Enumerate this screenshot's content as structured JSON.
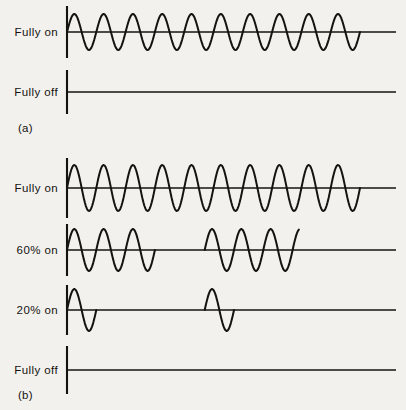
{
  "figure": {
    "background_color": "#f2f1ee",
    "ink_color": "#151310",
    "panels": [
      {
        "id": "a",
        "label": "(a)",
        "label_x": 18,
        "label_y": 122,
        "rows": [
          {
            "name": "fully-on",
            "label": "Fully on",
            "label_x": 58,
            "baseline_y": 32,
            "axis_x": 67,
            "axis_half_height": 26,
            "wave_start_x": 67,
            "wave_end_x": 360,
            "line_end_x": 396,
            "cycles": 10,
            "amplitude": 18,
            "burst_pattern": [
              [
                0,
                10
              ]
            ]
          },
          {
            "name": "fully-off",
            "label": "Fully off",
            "label_x": 58,
            "baseline_y": 92,
            "axis_x": 67,
            "axis_half_height": 22,
            "wave_start_x": 67,
            "wave_end_x": 67,
            "line_end_x": 396,
            "cycles": 10,
            "amplitude": 0,
            "burst_pattern": []
          }
        ]
      },
      {
        "id": "b",
        "label": "(b)",
        "label_x": 18,
        "label_y": 389,
        "rows": [
          {
            "name": "fully-on",
            "label": "Fully on",
            "label_x": 58,
            "baseline_y": 188,
            "axis_x": 67,
            "axis_half_height": 30,
            "wave_start_x": 67,
            "wave_end_x": 360,
            "line_end_x": 396,
            "cycles": 10,
            "amplitude": 23,
            "burst_pattern": [
              [
                0,
                10
              ]
            ]
          },
          {
            "name": "sixty-percent-on",
            "label": "60% on",
            "label_x": 58,
            "baseline_y": 250,
            "axis_x": 67,
            "axis_half_height": 26,
            "wave_start_x": 67,
            "wave_end_x": 360,
            "line_end_x": 396,
            "cycles": 10,
            "amplitude": 21,
            "burst_pattern": [
              [
                0,
                3
              ],
              [
                4.7,
                7.9
              ]
            ]
          },
          {
            "name": "twenty-percent-on",
            "label": "20% on",
            "label_x": 58,
            "baseline_y": 310,
            "axis_x": 67,
            "axis_half_height": 25,
            "wave_start_x": 67,
            "wave_end_x": 360,
            "line_end_x": 396,
            "cycles": 10,
            "amplitude": 21,
            "burst_pattern": [
              [
                0,
                1
              ],
              [
                4.7,
                5.7
              ]
            ]
          },
          {
            "name": "fully-off",
            "label": "Fully off",
            "label_x": 58,
            "baseline_y": 370,
            "axis_x": 67,
            "axis_half_height": 24,
            "wave_start_x": 67,
            "wave_end_x": 67,
            "line_end_x": 396,
            "cycles": 10,
            "amplitude": 0,
            "burst_pattern": []
          }
        ]
      }
    ]
  },
  "chart_data": {
    "type": "line",
    "xlabel": "",
    "ylabel": "",
    "grid": false,
    "legend": "none",
    "panels": [
      {
        "panel": "(a)",
        "series": [
          {
            "name": "Fully on",
            "description": "Continuous sinusoid, 10 cycles, full amplitude",
            "conduction_percent": 100,
            "cycles_shown": 10,
            "conducting_intervals_cycles": [
              [
                0,
                10
              ]
            ],
            "amplitude_relative": 1.0
          },
          {
            "name": "Fully off",
            "description": "Flat line at zero, no conduction",
            "conduction_percent": 0,
            "cycles_shown": 10,
            "conducting_intervals_cycles": [],
            "amplitude_relative": 0.0
          }
        ]
      },
      {
        "panel": "(b)",
        "series": [
          {
            "name": "Fully on",
            "description": "Continuous sinusoid, 10 cycles, full amplitude",
            "conduction_percent": 100,
            "cycles_shown": 10,
            "conducting_intervals_cycles": [
              [
                0,
                10
              ]
            ],
            "amplitude_relative": 1.0
          },
          {
            "name": "60% on",
            "description": "Burst firing: 3 cycles on, 2 cycles off, 3 cycles on, remainder off",
            "conduction_percent": 60,
            "cycles_shown": 10,
            "conducting_intervals_cycles": [
              [
                0,
                3
              ],
              [
                4.7,
                7.9
              ]
            ],
            "amplitude_relative": 1.0
          },
          {
            "name": "20% on",
            "description": "Burst firing: 1 cycle on, 4 cycles off, 1 cycle on, remainder off",
            "conduction_percent": 20,
            "cycles_shown": 10,
            "conducting_intervals_cycles": [
              [
                0,
                1
              ],
              [
                4.7,
                5.7
              ]
            ],
            "amplitude_relative": 1.0
          },
          {
            "name": "Fully off",
            "description": "Flat line at zero, no conduction",
            "conduction_percent": 0,
            "cycles_shown": 10,
            "conducting_intervals_cycles": [],
            "amplitude_relative": 0.0
          }
        ]
      }
    ]
  }
}
